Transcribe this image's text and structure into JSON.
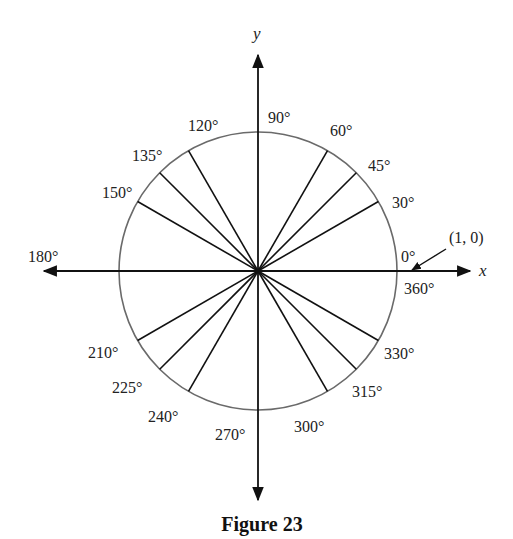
{
  "figure": {
    "caption": "Figure 23",
    "axes": {
      "x_label": "x",
      "y_label": "y"
    },
    "point_label": "(1, 0)",
    "center": [
      258,
      271
    ],
    "radius": 139,
    "colors": {
      "circle": "#6a6a6a",
      "lines": "#111111"
    },
    "spokes": [
      30,
      45,
      60,
      120,
      135,
      150,
      210,
      225,
      240,
      300,
      315,
      330
    ],
    "angle_labels": [
      {
        "angle": 0,
        "text": "0°",
        "x": 401,
        "y": 262
      },
      {
        "angle": 360,
        "text": "360°",
        "x": 404,
        "y": 294
      },
      {
        "angle": 30,
        "text": "30°",
        "x": 392,
        "y": 208
      },
      {
        "angle": 45,
        "text": "45°",
        "x": 368,
        "y": 171
      },
      {
        "angle": 60,
        "text": "60°",
        "x": 330,
        "y": 136
      },
      {
        "angle": 90,
        "text": "90°",
        "x": 268,
        "y": 123
      },
      {
        "angle": 120,
        "text": "120°",
        "x": 188,
        "y": 131
      },
      {
        "angle": 135,
        "text": "135°",
        "x": 132,
        "y": 161
      },
      {
        "angle": 150,
        "text": "150°",
        "x": 102,
        "y": 198
      },
      {
        "angle": 180,
        "text": "180°",
        "x": 28,
        "y": 262
      },
      {
        "angle": 210,
        "text": "210°",
        "x": 88,
        "y": 358
      },
      {
        "angle": 225,
        "text": "225°",
        "x": 112,
        "y": 393
      },
      {
        "angle": 240,
        "text": "240°",
        "x": 148,
        "y": 422
      },
      {
        "angle": 270,
        "text": "270°",
        "x": 215,
        "y": 440
      },
      {
        "angle": 300,
        "text": "300°",
        "x": 294,
        "y": 432
      },
      {
        "angle": 315,
        "text": "315°",
        "x": 352,
        "y": 397
      },
      {
        "angle": 330,
        "text": "330°",
        "x": 384,
        "y": 359
      }
    ]
  }
}
